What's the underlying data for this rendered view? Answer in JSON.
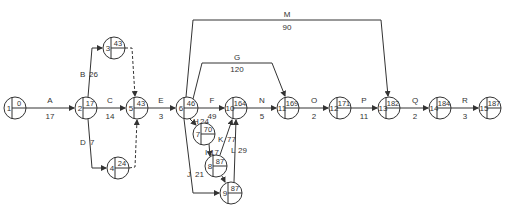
{
  "diagram": {
    "type": "activity-on-arrow network",
    "colors": {
      "line": "#333333",
      "background": "#ffffff"
    },
    "nodes": [
      {
        "id": "1",
        "value": "0",
        "x": 15,
        "y": 108
      },
      {
        "id": "2",
        "value": "17",
        "x": 86,
        "y": 108
      },
      {
        "id": "3",
        "value": "43",
        "x": 114,
        "y": 48
      },
      {
        "id": "4",
        "value": "24",
        "x": 118,
        "y": 168
      },
      {
        "id": "5",
        "value": "43",
        "x": 137,
        "y": 108
      },
      {
        "id": "6",
        "value": "46",
        "x": 187,
        "y": 108
      },
      {
        "id": "7",
        "value": "70",
        "x": 204,
        "y": 134
      },
      {
        "id": "8",
        "value": "87",
        "x": 216,
        "y": 166
      },
      {
        "id": "9",
        "value": "87",
        "x": 231,
        "y": 193
      },
      {
        "id": "10",
        "value": "164",
        "x": 236,
        "y": 108
      },
      {
        "id": "11",
        "value": "169",
        "x": 288,
        "y": 108
      },
      {
        "id": "12",
        "value": "171",
        "x": 340,
        "y": 108
      },
      {
        "id": "13",
        "value": "182",
        "x": 389,
        "y": 108
      },
      {
        "id": "14",
        "value": "184",
        "x": 440,
        "y": 108
      },
      {
        "id": "15",
        "value": "187",
        "x": 490,
        "y": 108
      }
    ],
    "activities": [
      {
        "name": "A",
        "duration": "17",
        "from": "1",
        "to": "2"
      },
      {
        "name": "B",
        "duration": "26",
        "from": "2",
        "to": "3"
      },
      {
        "name": "C",
        "duration": "14",
        "from": "2",
        "to": "5"
      },
      {
        "name": "D",
        "duration": "7",
        "from": "2",
        "to": "4"
      },
      {
        "name": "E",
        "duration": "3",
        "from": "5",
        "to": "6"
      },
      {
        "name": "F",
        "duration": "49",
        "from": "6",
        "to": "10"
      },
      {
        "name": "G",
        "duration": "120",
        "from": "6",
        "to": "11"
      },
      {
        "name": "H",
        "duration": "24",
        "from": "6",
        "to": "7"
      },
      {
        "name": "I",
        "duration": "17",
        "from": "7",
        "to": "8"
      },
      {
        "name": "J",
        "duration": "21",
        "from": "6",
        "to": "9"
      },
      {
        "name": "K",
        "duration": "77",
        "from": "8",
        "to": "10"
      },
      {
        "name": "L",
        "duration": "29",
        "from": "9",
        "to": "10"
      },
      {
        "name": "M",
        "duration": "90",
        "from": "6",
        "to": "13"
      },
      {
        "name": "N",
        "duration": "5",
        "from": "10",
        "to": "11"
      },
      {
        "name": "O",
        "duration": "2",
        "from": "11",
        "to": "12"
      },
      {
        "name": "P",
        "duration": "11",
        "from": "12",
        "to": "13"
      },
      {
        "name": "Q",
        "duration": "2",
        "from": "13",
        "to": "14"
      },
      {
        "name": "R",
        "duration": "3",
        "from": "14",
        "to": "15"
      }
    ],
    "dummies": [
      {
        "from": "3",
        "to": "5"
      },
      {
        "from": "4",
        "to": "5"
      },
      {
        "from": "8",
        "to": "9"
      }
    ]
  }
}
